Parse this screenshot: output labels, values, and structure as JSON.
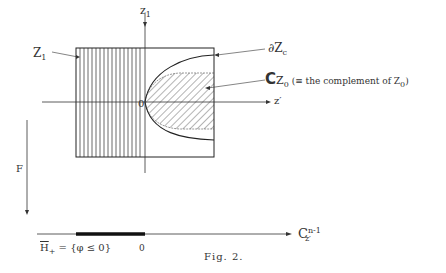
{
  "figure": {
    "caption": "Fig. 2.",
    "colors": {
      "ink": "#333333",
      "background": "#ffffff"
    }
  },
  "axes": {
    "vertical_label_main": "z",
    "vertical_label_sub": "1",
    "horizontal_label": "z′",
    "origin_label": "0"
  },
  "labels": {
    "z1_main": "Z",
    "z1_sub": "1",
    "boundary_main": "∂Z",
    "boundary_sub": "c",
    "complement_symbol": "C",
    "complement_main": "Z",
    "complement_sub": "0",
    "complement_note_pre": " (≡ the complement of  Z",
    "complement_note_sub": "0",
    "complement_note_post": ")",
    "map_label": "F"
  },
  "base_line": {
    "h_plus_main": "H",
    "h_plus_sub": "+",
    "h_plus_def": " = {φ ≤ 0}",
    "zero_label": "0",
    "space_main": "C",
    "space_sup": "n-1",
    "space_sub": "z′"
  }
}
